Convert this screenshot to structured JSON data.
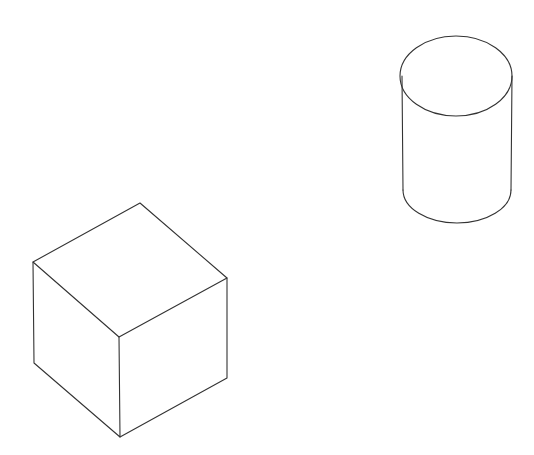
{
  "canvas": {
    "width": 534,
    "height": 455,
    "background": "#ffffff"
  },
  "style": {
    "stroke_color": "#333333",
    "stroke_width": 1.1
  },
  "shapes": [
    {
      "type": "cube",
      "vertices": {
        "top": [
          140,
          203
        ],
        "left_top": [
          33,
          262
        ],
        "right_top": [
          227,
          278
        ],
        "front_top": [
          119,
          337
        ],
        "left_bottom": [
          34,
          363
        ],
        "right_bottom": [
          227,
          378
        ],
        "front_bottom": [
          120,
          437
        ]
      }
    },
    {
      "type": "cylinder",
      "top_ellipse": {
        "cx": 456,
        "cy": 76,
        "rx": 56,
        "ry": 40
      },
      "left_side_x": 402,
      "right_side_x": 512,
      "side_bottom_y": 190,
      "bottom_lowest_y": 223
    }
  ]
}
